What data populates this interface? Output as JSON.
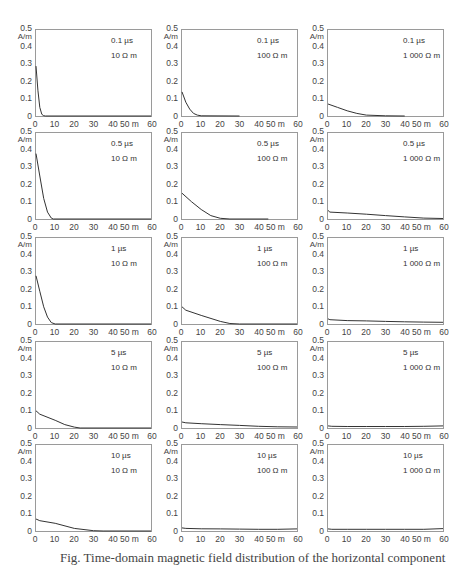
{
  "chart_data": {
    "type": "line",
    "layout": "5x3 grid of small multiples",
    "ylabel": "A/m",
    "xlabel": "m",
    "ylim": [
      0,
      0.5
    ],
    "xlim": [
      0,
      60
    ],
    "yticks": [
      "0",
      "0.1",
      "0.2",
      "0.3",
      "0.4",
      "0.5"
    ],
    "xticks": [
      "0",
      "10",
      "20",
      "30",
      "40",
      "50 m",
      "60"
    ],
    "grid": false,
    "panels": [
      {
        "time": "0.1 µs",
        "resistivity": "10 Ω m",
        "x": [
          0,
          1,
          2,
          3,
          4,
          5,
          60
        ],
        "y": [
          0.29,
          0.15,
          0.05,
          0.01,
          0.002,
          0,
          0
        ]
      },
      {
        "time": "0.1 µs",
        "resistivity": "100 Ω m",
        "x": [
          0,
          2,
          4,
          6,
          8,
          10,
          30
        ],
        "y": [
          0.14,
          0.08,
          0.04,
          0.015,
          0.005,
          0.001,
          0
        ]
      },
      {
        "time": "0.1 µs",
        "resistivity": "1 000 Ω m",
        "x": [
          0,
          5,
          10,
          15,
          20,
          30,
          40
        ],
        "y": [
          0.07,
          0.05,
          0.03,
          0.015,
          0.005,
          0.001,
          0
        ]
      },
      {
        "time": "0.5 µs",
        "resistivity": "10 Ω m",
        "x": [
          0,
          2,
          4,
          6,
          8,
          9,
          60
        ],
        "y": [
          0.38,
          0.25,
          0.12,
          0.04,
          0.005,
          0,
          0
        ]
      },
      {
        "time": "0.5 µs",
        "resistivity": "100 Ω m",
        "x": [
          0,
          5,
          10,
          15,
          20,
          25,
          45
        ],
        "y": [
          0.15,
          0.1,
          0.055,
          0.02,
          0.004,
          0,
          0
        ]
      },
      {
        "time": "0.5 µs",
        "resistivity": "1 000 Ω m",
        "x": [
          0,
          1,
          10,
          20,
          30,
          40,
          50,
          60
        ],
        "y": [
          0.05,
          0.04,
          0.035,
          0.028,
          0.02,
          0.012,
          0.005,
          0.003
        ]
      },
      {
        "time": "1 µs",
        "resistivity": "10 Ω m",
        "x": [
          0,
          2,
          4,
          6,
          8,
          10,
          60
        ],
        "y": [
          0.28,
          0.19,
          0.1,
          0.04,
          0.008,
          0,
          0
        ]
      },
      {
        "time": "1 µs",
        "resistivity": "100 Ω m",
        "x": [
          0,
          2,
          10,
          20,
          25,
          30,
          60
        ],
        "y": [
          0.1,
          0.08,
          0.05,
          0.015,
          0.003,
          0,
          0
        ]
      },
      {
        "time": "1 µs",
        "resistivity": "1 000 Ω m",
        "x": [
          0,
          1,
          10,
          20,
          30,
          40,
          50,
          60
        ],
        "y": [
          0.03,
          0.025,
          0.02,
          0.018,
          0.015,
          0.013,
          0.011,
          0.01
        ]
      },
      {
        "time": "5 µs",
        "resistivity": "10 Ω m",
        "x": [
          0,
          2,
          10,
          15,
          20,
          23,
          60
        ],
        "y": [
          0.1,
          0.08,
          0.045,
          0.02,
          0.005,
          0,
          0
        ]
      },
      {
        "time": "5 µs",
        "resistivity": "100 Ω m",
        "x": [
          0,
          2,
          10,
          20,
          30,
          40,
          50,
          60
        ],
        "y": [
          0.035,
          0.03,
          0.025,
          0.02,
          0.015,
          0.01,
          0.007,
          0.006
        ]
      },
      {
        "time": "5 µs",
        "resistivity": "1 000 Ω m",
        "x": [
          0,
          2,
          10,
          20,
          30,
          40,
          50,
          60
        ],
        "y": [
          0.012,
          0.01,
          0.009,
          0.009,
          0.009,
          0.009,
          0.01,
          0.012
        ]
      },
      {
        "time": "10 µs",
        "resistivity": "10 Ω m",
        "x": [
          0,
          2,
          10,
          20,
          30,
          35,
          60
        ],
        "y": [
          0.07,
          0.06,
          0.045,
          0.015,
          0.002,
          0,
          0
        ]
      },
      {
        "time": "10 µs",
        "resistivity": "100 Ω m",
        "x": [
          0,
          2,
          10,
          20,
          30,
          40,
          50,
          60
        ],
        "y": [
          0.018,
          0.015,
          0.013,
          0.012,
          0.011,
          0.01,
          0.01,
          0.012
        ]
      },
      {
        "time": "10 µs",
        "resistivity": "1 000 Ω m",
        "x": [
          0,
          2,
          10,
          20,
          30,
          40,
          50,
          60
        ],
        "y": [
          0.012,
          0.01,
          0.01,
          0.01,
          0.01,
          0.01,
          0.01,
          0.014
        ]
      }
    ]
  },
  "caption": "Fig.  Time-domain magnetic field distribution of the horizontal component"
}
